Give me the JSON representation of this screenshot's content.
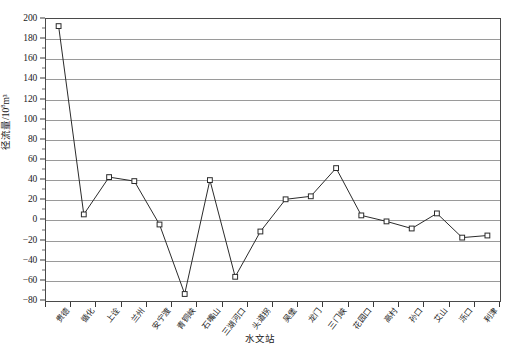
{
  "chart_data": {
    "type": "line",
    "title": "",
    "xlabel": "水文站",
    "ylabel": "径流量/10⁸m³",
    "ylabel_base": "径流量/10",
    "ylabel_sup": "8",
    "ylabel_tail": "m³",
    "ylim": [
      -80,
      200
    ],
    "ytick_step": 20,
    "grid": true,
    "legend": "none",
    "marker": "open-square",
    "line_color": "#2b2b2b",
    "grid_color": "#9a9a9a",
    "axis_color": "#4a4a4a",
    "categories": [
      "贵德",
      "循化",
      "上诠",
      "兰州",
      "安宁渡",
      "青铜峡",
      "石嘴山",
      "三湖河口",
      "头道拐",
      "吴堡",
      "龙门",
      "三门峡",
      "花园口",
      "高村",
      "孙口",
      "艾山",
      "泺口",
      "利津"
    ],
    "values": [
      193,
      6,
      43,
      39,
      -4,
      -73,
      40,
      -56,
      -11,
      21,
      24,
      52,
      5,
      -1,
      -8,
      7,
      -17,
      -15
    ],
    "yticks": [
      200,
      180,
      160,
      140,
      120,
      100,
      80,
      60,
      40,
      20,
      0,
      -20,
      -40,
      -60,
      -80
    ],
    "ytick_labels": [
      "200",
      "180",
      "160",
      "140",
      "120",
      "100",
      "80",
      "60",
      "40",
      "20",
      "0",
      "-20",
      "-40",
      "-60",
      "-80"
    ]
  }
}
